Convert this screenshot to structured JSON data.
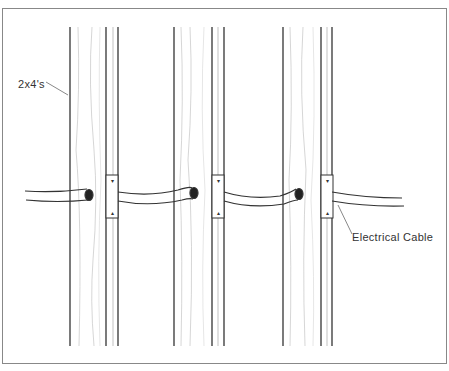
{
  "figure": {
    "type": "illustration",
    "labels": {
      "studs": "2x4's",
      "cable": "Electrical Cable"
    },
    "studs": [
      {
        "x": 70,
        "width": 48
      },
      {
        "x": 174,
        "width": 51
      },
      {
        "x": 283,
        "width": 50
      }
    ],
    "colors": {
      "line": "#333333",
      "grain": "#b0b0b0",
      "frame": "#888888"
    }
  }
}
